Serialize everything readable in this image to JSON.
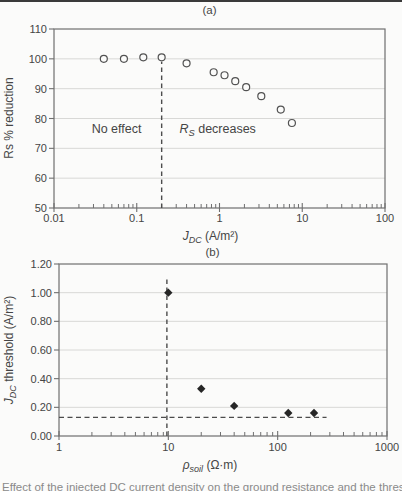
{
  "page": {
    "caption_fragment": "Effect of the injected DC current density on the ground resistance and the threshold values"
  },
  "colors": {
    "background": "#fbfbfa",
    "axis": "#6f6f6f",
    "grid": "#d8d8d6",
    "text": "#454545",
    "marker_open_stroke": "#525252",
    "marker_filled": "#262626",
    "dashed": "#4c4c4c",
    "crop_line": "#3a3a3a"
  },
  "chart_data": [
    {
      "panel_label": "(a)",
      "type": "scatter",
      "marker": "circle-open",
      "xscale": "log",
      "xlim": [
        0.01,
        100
      ],
      "ylim": [
        50,
        110
      ],
      "xticks": [
        0.01,
        0.1,
        1,
        10,
        100
      ],
      "xtick_labels": [
        "0.01",
        "0.1",
        "1",
        "10",
        "100"
      ],
      "yticks": [
        50,
        60,
        70,
        80,
        90,
        100,
        110
      ],
      "ytick_labels": [
        "50",
        "60",
        "70",
        "80",
        "90",
        "100",
        "110"
      ],
      "grid": "horizontal",
      "xlabel_runs": [
        {
          "text": "J",
          "italic": true
        },
        {
          "text": "DC",
          "italic": true,
          "sub": true
        },
        {
          "text": " (A/m²)"
        }
      ],
      "ylabel_runs": [
        {
          "text": "Rs % reduction"
        }
      ],
      "points": [
        [
          0.04,
          100
        ],
        [
          0.07,
          100
        ],
        [
          0.12,
          100.5
        ],
        [
          0.2,
          100.5
        ],
        [
          0.4,
          98.5
        ],
        [
          0.85,
          95.5
        ],
        [
          1.15,
          94.5
        ],
        [
          1.55,
          92.5
        ],
        [
          2.1,
          90.5
        ],
        [
          3.2,
          87.5
        ],
        [
          5.5,
          83
        ],
        [
          7.5,
          78.5
        ]
      ],
      "annotations": [
        {
          "x": 0.057,
          "y": 75,
          "runs": [
            {
              "text": "No effect"
            }
          ]
        },
        {
          "x": 0.95,
          "y": 75,
          "runs": [
            {
              "text": "R",
              "italic": true
            },
            {
              "text": "S",
              "italic": true,
              "sub": true
            },
            {
              "text": " decreases"
            }
          ]
        }
      ],
      "ref_lines": [
        {
          "orient": "v",
          "at": 0.2,
          "from": 50,
          "to": 99
        }
      ]
    },
    {
      "panel_label": "(b)",
      "type": "scatter",
      "marker": "diamond-filled",
      "xscale": "log",
      "xlim": [
        1,
        1000
      ],
      "ylim": [
        0,
        1.2
      ],
      "xticks": [
        1,
        10,
        100,
        1000
      ],
      "xtick_labels": [
        "1",
        "10",
        "100",
        "1000"
      ],
      "yticks": [
        0,
        0.2,
        0.4,
        0.6,
        0.8,
        1.0,
        1.2
      ],
      "ytick_labels": [
        "0.00",
        "0.20",
        "0.40",
        "0.60",
        "0.80",
        "1.00",
        "1.20"
      ],
      "grid": "horizontal",
      "xlabel_runs": [
        {
          "text": "ρ",
          "italic": true
        },
        {
          "text": "soil",
          "italic": true,
          "sub": true
        },
        {
          "text": " (Ω·m)"
        }
      ],
      "ylabel_runs": [
        {
          "text": "J",
          "italic": true
        },
        {
          "text": "DC",
          "italic": true,
          "sub": true
        },
        {
          "text": " threshold (A/m²)"
        }
      ],
      "points": [
        [
          10,
          1.0
        ],
        [
          20,
          0.33
        ],
        [
          40,
          0.21
        ],
        [
          125,
          0.16
        ],
        [
          215,
          0.16
        ]
      ],
      "annotations": [],
      "ref_lines": [
        {
          "orient": "v",
          "at": 9.7,
          "from": 0,
          "to": 1.1
        },
        {
          "orient": "h",
          "at": 0.13,
          "from": 1,
          "to": 280
        }
      ]
    }
  ]
}
